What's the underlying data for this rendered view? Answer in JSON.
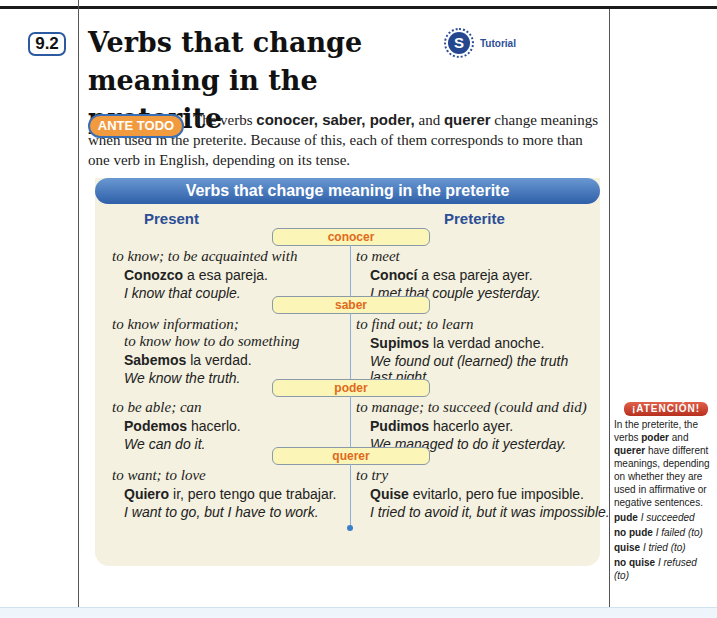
{
  "section": {
    "number": "9.2",
    "title": "Verbs that change meaning in the preterite",
    "tutorial_label": "Tutorial",
    "tutorial_icon": "S"
  },
  "intro": {
    "badge": "ANTE TODO",
    "pre": "The verbs ",
    "verbs": "conocer, saber, poder,",
    "mid": " and ",
    "verb_last": "querer",
    "post": " change meanings when used in the preterite. Because of this, each of them corresponds to more than one verb in English, depending on its tense."
  },
  "chart": {
    "title": "Verbs that change meaning in the preterite",
    "col_present": "Present",
    "col_preterite": "Preterite",
    "verbs": [
      {
        "name": "conocer",
        "present_meaning": [
          "to know; to be acquainted with"
        ],
        "present_bold": "Conozco",
        "present_rest": " a esa pareja.",
        "present_tr": [
          "I know that couple."
        ],
        "pret_meaning": "to meet",
        "pret_bold": "Conocí",
        "pret_rest": " a esa pareja ayer.",
        "pret_tr": [
          "I met that couple yesterday."
        ]
      },
      {
        "name": "saber",
        "present_meaning": [
          "to know information;",
          "to know how to do something"
        ],
        "present_bold": "Sabemos",
        "present_rest": " la verdad.",
        "present_tr": [
          "We know the truth."
        ],
        "pret_meaning": "to find out; to learn",
        "pret_bold": "Supimos",
        "pret_rest": " la verdad anoche.",
        "pret_tr": [
          "We found out (learned) the truth",
          "last night."
        ]
      },
      {
        "name": "poder",
        "present_meaning": [
          "to be able; can"
        ],
        "present_bold": "Podemos",
        "present_rest": " hacerlo.",
        "present_tr": [
          "We can do it."
        ],
        "pret_meaning": "to manage; to succeed (could and did)",
        "pret_bold": "Pudimos",
        "pret_rest": " hacerlo ayer.",
        "pret_tr": [
          "We managed to do it yesterday."
        ]
      },
      {
        "name": "querer",
        "present_meaning": [
          "to want; to love"
        ],
        "present_bold": "Quiero",
        "present_rest": " ir, pero tengo que trabajar.",
        "present_tr": [
          "I want to go, but I have to work."
        ],
        "pret_meaning": "to try",
        "pret_bold": "Quise",
        "pret_rest": " evitarlo, pero fue imposible.",
        "pret_tr": [
          "I tried to avoid it, but it was impossible."
        ]
      }
    ]
  },
  "atencion": {
    "badge": "¡ATENCIÓN!",
    "t1": "In the preterite, the verbs ",
    "b1": "poder",
    "t2": " and ",
    "b2": "querer",
    "t3": " have different meanings, depending on whether they are used in affirmative or negative sentences.",
    "pairs": [
      {
        "es": "pude",
        "en": "I succeeded"
      },
      {
        "es": "no pude",
        "en": "I failed (to)"
      },
      {
        "es": "quise",
        "en": "I tried (to)"
      },
      {
        "es": "no quise",
        "en": "I refused (to)"
      }
    ]
  },
  "colors": {
    "accent_blue": "#2c5aa0",
    "orange": "#f19a3e",
    "verb_label": "#e06a1a",
    "panel": "#f4f1e0",
    "atencion_red": "#c0392b"
  }
}
